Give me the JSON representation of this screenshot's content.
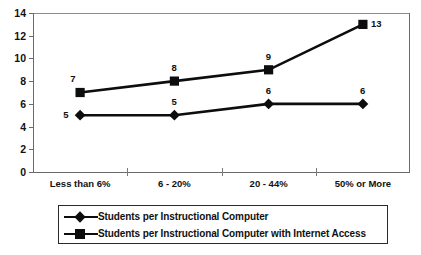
{
  "chart_data": {
    "type": "line",
    "title": "",
    "subtitle": "",
    "xlabel": "",
    "ylabel": "",
    "categories": [
      "Less than 6%",
      "6 - 20%",
      "20 - 44%",
      "50% or More"
    ],
    "ylim": [
      0,
      14
    ],
    "yticks": [
      0,
      2,
      4,
      6,
      8,
      10,
      12,
      14
    ],
    "ytick_labels": [
      "0",
      "2",
      "4",
      "6",
      "8",
      "10",
      "12",
      "14"
    ],
    "grid": "top-border-only",
    "legend_position": "bottom",
    "series": [
      {
        "name": "Students per Instructional Computer",
        "marker": "diamond",
        "color": "#0d0d0d",
        "values": [
          5,
          5,
          6,
          6
        ],
        "data_labels": [
          "5",
          "5",
          "6",
          "6"
        ]
      },
      {
        "name": "Students per Instructional Computer with Internet Access",
        "marker": "square",
        "color": "#0d0d0d",
        "values": [
          7,
          8,
          9,
          13
        ],
        "data_labels": [
          "7",
          "8",
          "9",
          "13"
        ]
      }
    ]
  },
  "legend": {
    "items": [
      {
        "label": "Students per Instructional Computer",
        "marker": "diamond-marker-icon"
      },
      {
        "label": "Students per Instructional Computer with Internet Access",
        "marker": "square-marker-icon"
      }
    ]
  },
  "artifact": {
    "text": ""
  }
}
